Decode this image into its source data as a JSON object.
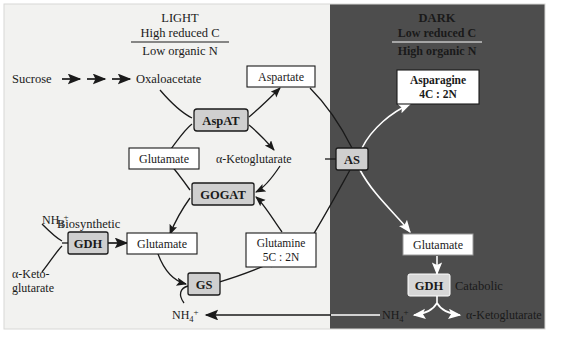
{
  "figure": {
    "light_panel": {
      "heading": "LIGHT",
      "numerator": "High reduced C",
      "denominator": "Low organic N",
      "bg_color": "#f2f2f0"
    },
    "dark_panel": {
      "heading": "DARK",
      "numerator": "Low reduced C",
      "denominator": "High organic N",
      "bg_color": "#4d4d4d",
      "text_color": "#ffffff"
    }
  },
  "metabolites": {
    "sucrose": "Sucrose",
    "oxaloacetate": "Oxaloacetate",
    "aspartate": "Aspartate",
    "glutamate_upper": "Glutamate",
    "alpha_ketoglutarate_center": "α-Ketoglutarate",
    "glutamate_left": "Glutamate",
    "glutamine_name": "Glutamine",
    "glutamine_ratio": "5C : 2N",
    "asparagine_name": "Asparagine",
    "asparagine_ratio": "4C : 2N",
    "glutamate_dark": "Glutamate",
    "ammonium_left": "NH",
    "ammonium_left_sub": "4",
    "ammonium_left_sup": "+",
    "ammonium_bottom_light": "NH",
    "ammonium_bottom_light_sub": "4",
    "ammonium_bottom_light_sup": "+",
    "ammonium_bottom_dark": "NH",
    "ammonium_bottom_dark_sub": "4",
    "ammonium_bottom_dark_sup": "+",
    "alpha_keto_line1": "α-Keto-",
    "alpha_keto_line2": "glutarate",
    "alpha_ketoglutarate_dark": "α-Ketoglutarate"
  },
  "enzymes": {
    "aspat": "AspAT",
    "gogat": "GOGAT",
    "gdh_biosynthetic": "GDH",
    "gs": "GS",
    "as": "AS",
    "gdh_catabolic": "GDH",
    "box_fill": "#cfcfcf",
    "box_stroke": "#1a1a1a"
  },
  "annotations": {
    "biosynthetic": "Biosynthetic",
    "catabolic": "Catabolic"
  }
}
